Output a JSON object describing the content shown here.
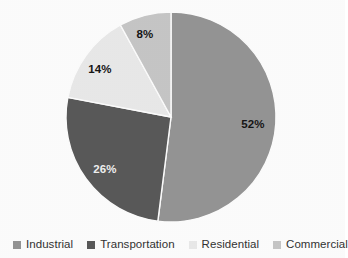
{
  "chart_data": {
    "type": "pie",
    "title": "",
    "subtitle": "",
    "xlabel": "",
    "ylabel": "",
    "grid": false,
    "legend_position": "bottom",
    "start_angle_deg": 0,
    "direction": "clockwise",
    "categories": [
      "Industrial",
      "Transportation",
      "Residential",
      "Commercial"
    ],
    "values": [
      52,
      26,
      14,
      8
    ],
    "value_unit": "%",
    "data_labels": [
      "52%",
      "26%",
      "14%",
      "8%"
    ],
    "colors": [
      "#969696",
      "#5a5a5a",
      "#ebebeb",
      "#c8c8c8"
    ],
    "slices": [
      {
        "label": "Industrial",
        "value": 52,
        "data_label": "52%",
        "color": "#969696",
        "label_x": 253,
        "label_y": 125,
        "label_on_dark": false
      },
      {
        "label": "Transportation",
        "value": 26,
        "data_label": "26%",
        "color": "#5a5a5a",
        "label_x": 105,
        "label_y": 170,
        "label_on_dark": true
      },
      {
        "label": "Residential",
        "value": 14,
        "data_label": "14%",
        "color": "#ebebeb",
        "label_x": 100,
        "label_y": 70,
        "label_on_dark": false
      },
      {
        "label": "Commercial",
        "value": 8,
        "data_label": "8%",
        "color": "#c8c8c8",
        "label_x": 145,
        "label_y": 35,
        "label_on_dark": false
      }
    ],
    "geometry": {
      "center_x": 171,
      "center_y": 117,
      "radius": 105
    }
  },
  "legend": {
    "items": [
      {
        "label": "Industrial",
        "color": "#969696"
      },
      {
        "label": "Transportation",
        "color": "#5a5a5a"
      },
      {
        "label": "Residential",
        "color": "#ebebeb"
      },
      {
        "label": "Commercial",
        "color": "#c8c8c8"
      }
    ]
  },
  "colors": {
    "background": "#ffffff",
    "label_text": "#161616",
    "label_text_on_dark": "#f2f2f2",
    "legend_text": "#333333"
  }
}
